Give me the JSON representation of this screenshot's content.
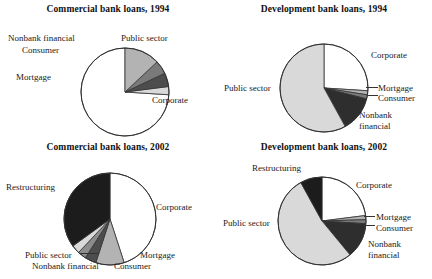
{
  "figure": {
    "background": "#ffffff",
    "panels": [
      {
        "id": "commercial-1994",
        "title": "Commercial bank loans, 1994",
        "labels": {
          "corporate": "Corporate",
          "mortgage": "Mortgage",
          "consumer": "Consumer",
          "nonbank": "Nonbank financial",
          "public": "Public sector"
        }
      },
      {
        "id": "development-1994",
        "title": "Development bank loans, 1994",
        "labels": {
          "corporate": "Corporate",
          "mortgage": "Mortgage",
          "consumer": "Consumer",
          "nonbank_line1": "Nonbank",
          "nonbank_line2": "financial",
          "public": "Public sector"
        }
      },
      {
        "id": "commercial-2002",
        "title": "Commercial bank loans, 2002",
        "labels": {
          "corporate": "Corporate",
          "mortgage": "Mortgage",
          "consumer": "Consumer",
          "nonbank": "Nonbank financial",
          "public": "Public sector",
          "restructuring": "Restructuring"
        }
      },
      {
        "id": "development-2002",
        "title": "Development bank loans, 2002",
        "labels": {
          "corporate": "Corporate",
          "mortgage": "Mortgage",
          "consumer": "Consumer",
          "nonbank_line1": "Nonbank",
          "nonbank_line2": "financial",
          "public": "Public sector",
          "restructuring": "Restructuring"
        }
      }
    ]
  },
  "palette": {
    "white": "#ffffff",
    "light_gray": "#d9d9d9",
    "mid_gray": "#b3b3b3",
    "dark_gray": "#7a7a7a",
    "very_dark": "#4d4d4d",
    "black": "#1c1c1c",
    "stroke": "#333333"
  },
  "chart_data": [
    {
      "type": "pie",
      "title": "Commercial bank loans, 1994",
      "legend_position": "callout-labels",
      "start_angle_deg": 0,
      "direction": "counterclockwise",
      "categories": [
        "Corporate",
        "Public sector",
        "Nonbank financial",
        "Consumer",
        "Mortgage"
      ],
      "values": [
        74,
        3,
        5,
        5,
        13
      ],
      "colors": [
        "#ffffff",
        "#d9d9d9",
        "#4d4d4d",
        "#7a7a7a",
        "#b3b3b3"
      ],
      "units": "percent of total loans"
    },
    {
      "type": "pie",
      "title": "Development bank loans, 1994",
      "legend_position": "callout-labels",
      "start_angle_deg": 0,
      "direction": "clockwise",
      "categories": [
        "Corporate",
        "Mortgage",
        "Consumer",
        "Nonbank financial",
        "Public sector"
      ],
      "values": [
        26,
        1.5,
        1.5,
        13,
        58
      ],
      "colors": [
        "#ffffff",
        "#b3b3b3",
        "#7a7a7a",
        "#2e2e2e",
        "#d9d9d9"
      ],
      "units": "percent of total loans"
    },
    {
      "type": "pie",
      "title": "Commercial bank loans, 2002",
      "legend_position": "callout-labels",
      "start_angle_deg": 0,
      "direction": "clockwise",
      "categories": [
        "Corporate",
        "Mortgage",
        "Consumer",
        "Nonbank financial",
        "Public sector",
        "Restructuring"
      ],
      "values": [
        45,
        10,
        4,
        3,
        3,
        35
      ],
      "colors": [
        "#ffffff",
        "#b3b3b3",
        "#4d4d4d",
        "#8c8c8c",
        "#d9d9d9",
        "#1c1c1c"
      ],
      "units": "percent of total loans"
    },
    {
      "type": "pie",
      "title": "Development bank loans, 2002",
      "legend_position": "callout-labels",
      "start_angle_deg": 0,
      "direction": "clockwise",
      "categories": [
        "Corporate",
        "Mortgage",
        "Consumer",
        "Nonbank financial",
        "Public sector",
        "Restructuring"
      ],
      "values": [
        23,
        1.5,
        1.5,
        13,
        53,
        8
      ],
      "colors": [
        "#ffffff",
        "#b3b3b3",
        "#7a7a7a",
        "#2e2e2e",
        "#d9d9d9",
        "#1c1c1c"
      ],
      "units": "percent of total loans"
    }
  ]
}
